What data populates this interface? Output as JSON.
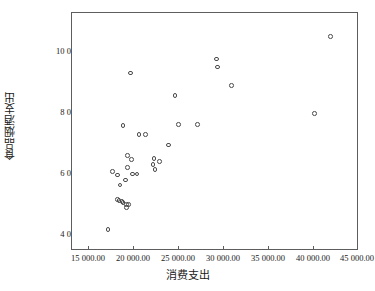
{
  "chart_data": {
    "type": "scatter",
    "title": "",
    "xlabel": "消费支出",
    "ylabel": "食品烟酒支出",
    "xlim": [
      15000,
      45000
    ],
    "ylim": [
      3600,
      11200
    ],
    "xticks": [
      15000,
      20000,
      25000,
      30000,
      35000,
      40000,
      45000
    ],
    "yticks": [
      4000,
      6000,
      8000,
      10000
    ],
    "xticklabels": [
      "15 000.00",
      "20 000.00",
      "25 000.00",
      "30 000.00",
      "35 000.00",
      "40 000.00",
      "45 000.00"
    ],
    "yticklabels": [
      "4 000.00",
      "6 000.00",
      "8 000.00",
      "10 000.00"
    ],
    "grid": false,
    "legend": null,
    "marker": "open-circle",
    "marker_color": "#4a4a4a",
    "points": [
      {
        "x": 18889,
        "y": 4246
      },
      {
        "x": 19333,
        "y": 6098
      },
      {
        "x": 19889,
        "y": 6000
      },
      {
        "x": 19889,
        "y": 5213
      },
      {
        "x": 20000,
        "y": 5180
      },
      {
        "x": 20111,
        "y": 5672
      },
      {
        "x": 20333,
        "y": 5148
      },
      {
        "x": 20444,
        "y": 5115
      },
      {
        "x": 20444,
        "y": 7574
      },
      {
        "x": 20667,
        "y": 5836
      },
      {
        "x": 20778,
        "y": 5049
      },
      {
        "x": 20778,
        "y": 4951
      },
      {
        "x": 20889,
        "y": 6230
      },
      {
        "x": 20889,
        "y": 6623
      },
      {
        "x": 21000,
        "y": 5049
      },
      {
        "x": 21222,
        "y": 9246
      },
      {
        "x": 21333,
        "y": 6492
      },
      {
        "x": 21444,
        "y": 6033
      },
      {
        "x": 21889,
        "y": 6033
      },
      {
        "x": 22111,
        "y": 7279
      },
      {
        "x": 22778,
        "y": 7279
      },
      {
        "x": 23556,
        "y": 6328
      },
      {
        "x": 23667,
        "y": 6525
      },
      {
        "x": 23778,
        "y": 6164
      },
      {
        "x": 24222,
        "y": 6426
      },
      {
        "x": 25222,
        "y": 6951
      },
      {
        "x": 25889,
        "y": 8525
      },
      {
        "x": 26222,
        "y": 7607
      },
      {
        "x": 28222,
        "y": 7607
      },
      {
        "x": 30222,
        "y": 9705
      },
      {
        "x": 30333,
        "y": 9443
      },
      {
        "x": 31778,
        "y": 8852
      },
      {
        "x": 40444,
        "y": 7967
      },
      {
        "x": 42111,
        "y": 10426
      }
    ]
  }
}
